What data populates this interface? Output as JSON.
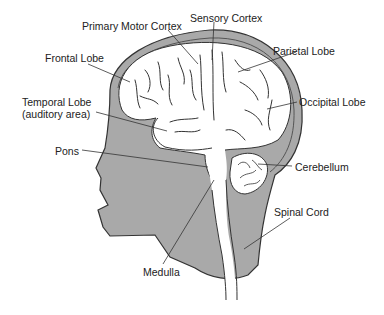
{
  "diagram": {
    "colors": {
      "head": "#a9a9a9",
      "brain": "#ffffff",
      "outline": "#333333",
      "text": "#222222",
      "leader": "#333333"
    },
    "labels": [
      {
        "id": "primary-motor-cortex",
        "text": "Primary Motor Cortex",
        "x": 82,
        "y": 20
      },
      {
        "id": "sensory-cortex",
        "text": "Sensory Cortex",
        "x": 190,
        "y": 14
      },
      {
        "id": "frontal-lobe",
        "text": "Frontal Lobe",
        "x": 45,
        "y": 52
      },
      {
        "id": "parietal-lobe",
        "text": "Parietal Lobe",
        "x": 273,
        "y": 45
      },
      {
        "id": "temporal-lobe",
        "text": "Temporal Lobe",
        "x": 22,
        "y": 95
      },
      {
        "id": "temporal-lobe-sub",
        "text": "(auditory area)",
        "x": 22,
        "y": 107
      },
      {
        "id": "occipital-lobe",
        "text": "Occipital Lobe",
        "x": 299,
        "y": 96
      },
      {
        "id": "pons",
        "text": "Pons",
        "x": 55,
        "y": 145
      },
      {
        "id": "cerebellum",
        "text": "Cerebellum",
        "x": 295,
        "y": 161
      },
      {
        "id": "spinal-cord",
        "text": "Spinal Cord",
        "x": 274,
        "y": 206
      },
      {
        "id": "medulla",
        "text": "Medulla",
        "x": 143,
        "y": 266
      }
    ]
  }
}
